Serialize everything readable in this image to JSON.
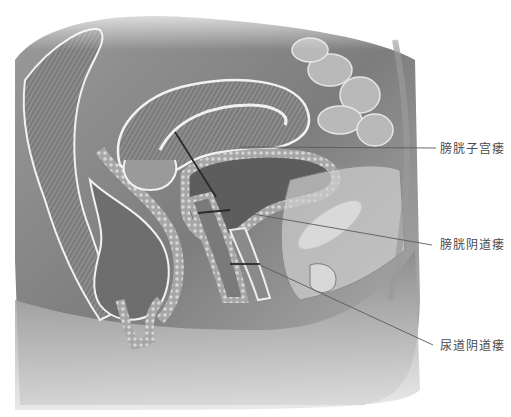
{
  "figure": {
    "colors": {
      "background": "#ffffff",
      "label_text": "#4a4a4a",
      "leader_line": "#2a2a2a",
      "tissue_dark": "#5a5a5a",
      "tissue_mid": "#8c8c8c",
      "tissue_light": "#c8c8c8",
      "outline": "#f2f2f2"
    },
    "labels": [
      {
        "id": "vesicouterine",
        "text": "膀胱子宫瘘",
        "x": 440,
        "y": 142,
        "line": {
          "x1": 175,
          "y1": 132,
          "x2": 216,
          "y2": 197,
          "x3": 240,
          "y3": 148,
          "tx": 436,
          "ty": 148
        }
      },
      {
        "id": "vesicovaginal",
        "text": "膀胱阴道瘘",
        "x": 440,
        "y": 238,
        "line": {
          "x1": 200,
          "y1": 213,
          "x2": 228,
          "y2": 210,
          "tx": 432,
          "ty": 245
        }
      },
      {
        "id": "urethrovaginal",
        "text": "尿道阴道瘘",
        "x": 440,
        "y": 339,
        "line": {
          "x1": 230,
          "y1": 263,
          "x2": 260,
          "y2": 263,
          "tx": 433,
          "ty": 345
        }
      }
    ]
  }
}
